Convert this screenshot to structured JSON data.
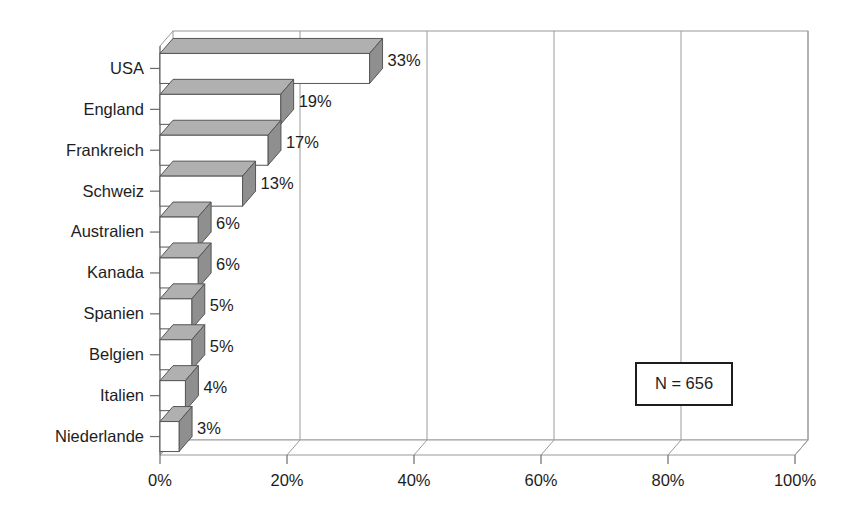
{
  "chart_data": {
    "type": "bar",
    "orientation": "horizontal",
    "style": "3d",
    "title": "",
    "subtitle": "",
    "xlabel": "",
    "ylabel": "",
    "categories": [
      "USA",
      "England",
      "Frankreich",
      "Schweiz",
      "Australien",
      "Kanada",
      "Spanien",
      "Belgien",
      "Italien",
      "Niederlande"
    ],
    "values": [
      33,
      19,
      17,
      13,
      6,
      6,
      5,
      5,
      4,
      3
    ],
    "data_labels": [
      "33%",
      "19%",
      "17%",
      "13%",
      "6%",
      "6%",
      "5%",
      "5%",
      "4%",
      "3%"
    ],
    "xlim": [
      0,
      100
    ],
    "xticks": [
      0,
      20,
      40,
      60,
      80,
      100
    ],
    "xtick_labels": [
      "0%",
      "20%",
      "40%",
      "60%",
      "80%",
      "100%"
    ],
    "grid": true,
    "grid_axis": "x",
    "legend": null,
    "annotations": [
      {
        "name": "sample-size",
        "text": "N = 656",
        "boxed": true
      }
    ]
  },
  "colors": {
    "bar_front": "#ffffff",
    "bar_top": "#b0b0b0",
    "bar_side": "#8f8f8f",
    "outline": "#555555",
    "grid": "#9a9a9a",
    "axis": "#6b6b6b",
    "text": "#1d1d1d",
    "background": "#ffffff"
  },
  "annotation_box": {
    "label": "N = 656"
  }
}
